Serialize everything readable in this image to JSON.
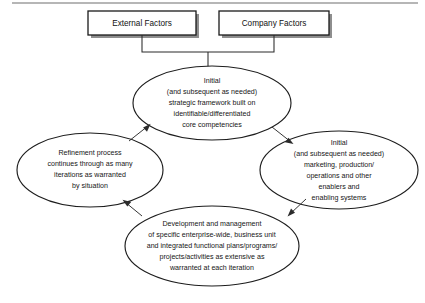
{
  "diagram": {
    "type": "cycle-flow-diagram",
    "colors": {
      "background": "#ffffff",
      "stroke": "#1d1d1d",
      "box_stroke": "#1a1a1a",
      "box_shadow": "#8e8e8e",
      "text": "#161616",
      "rule": "#6f6f6f"
    },
    "top_rule": {
      "name": "horizontal-rule",
      "x1": 12,
      "x2": 418,
      "y": 3
    },
    "boxes": [
      {
        "id": "external-factors",
        "label": "External Factors",
        "x": 88,
        "y": 11,
        "width": 108,
        "height": 24
      },
      {
        "id": "company-factors",
        "label": "Company Factors",
        "x": 219,
        "y": 11,
        "width": 110,
        "height": 24
      }
    ],
    "ellipses": [
      {
        "id": "strategic-framework",
        "cx": 212,
        "cy": 103,
        "rx": 79,
        "ry": 37,
        "lines": [
          "Initial",
          "(and subsequent as needed)",
          "strategic framework built on",
          "identifiable/differentiated",
          "core competencies"
        ]
      },
      {
        "id": "enablers-systems",
        "cx": 339,
        "cy": 170,
        "rx": 79,
        "ry": 39,
        "lines": [
          "Initial",
          "(and subsequent as needed)",
          "marketing, production/",
          "operations and other",
          "enablers and",
          "enabling systems"
        ]
      },
      {
        "id": "development-management",
        "cx": 212,
        "cy": 246,
        "rx": 87,
        "ry": 40,
        "lines": [
          "Development and management",
          "of specific enterprise-wide, business unit",
          "and integrated functional plans/programs/",
          "projects/activities as extensive as",
          "warranted at each iteration"
        ]
      },
      {
        "id": "refinement-process",
        "cx": 90,
        "cy": 170,
        "rx": 73,
        "ry": 37,
        "lines": [
          "Refinement process",
          "continues through as many",
          "iterations as warranted",
          "by situation"
        ]
      }
    ],
    "connectors": [
      {
        "id": "boxes-to-strategic-framework",
        "from": "external-factors + company-factors",
        "to": "strategic-framework",
        "arrow": false
      },
      {
        "id": "strategic-framework-to-enablers",
        "from": "strategic-framework",
        "to": "enablers-systems",
        "arrow": true
      },
      {
        "id": "enablers-to-development",
        "from": "enablers-systems",
        "to": "development-management",
        "arrow": true
      },
      {
        "id": "development-to-refinement",
        "from": "development-management",
        "to": "refinement-process",
        "arrow": true
      },
      {
        "id": "refinement-to-strategic-framework",
        "from": "refinement-process",
        "to": "strategic-framework",
        "arrow": true
      }
    ]
  }
}
